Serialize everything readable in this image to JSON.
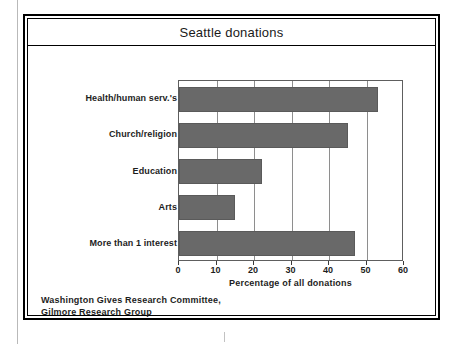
{
  "figure": {
    "title": "Seattle donations",
    "source_lines": [
      "Washington Gives Research Committee,",
      "Gilmore Research Group"
    ]
  },
  "chart_data": {
    "type": "bar",
    "orientation": "horizontal",
    "title": "Seattle donations",
    "categories": [
      "Health/human serv.'s",
      "Church/religion",
      "Education",
      "Arts",
      "More than 1 interest"
    ],
    "values": [
      53,
      45,
      22,
      15,
      47
    ],
    "xlabel": "Percentage of all donations",
    "ylabel": "",
    "xlim": [
      0,
      60
    ],
    "xticks": [
      0,
      10,
      20,
      30,
      40,
      50,
      60
    ],
    "xtick_labels": [
      "0",
      "10",
      "20",
      "30",
      "40",
      "50",
      "60"
    ],
    "grid": "vertical",
    "legend": "none",
    "bar_color": "#696969",
    "source": "Washington Gives Research Committee, Gilmore Research Group"
  }
}
